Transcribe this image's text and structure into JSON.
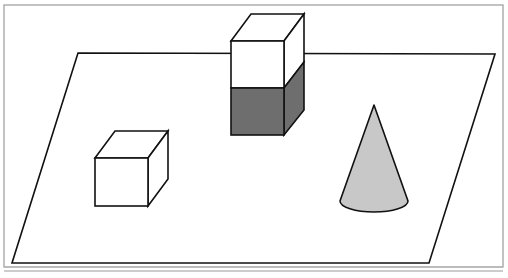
{
  "figure": {
    "colors": {
      "background": "#ffffff",
      "frame": "#9a9a9a",
      "stroke": "#111111",
      "cube_dark_fill": "#6e6e6e",
      "cone_fill": "#c8c8c8",
      "face_white": "#ffffff"
    },
    "frame": {
      "x": 4,
      "y": 5,
      "w": 499,
      "h": 262,
      "bottom_rule_y": 271
    },
    "plane": {
      "points": "78,53 495,54 429,263 12,263"
    },
    "stacked_cubes": {
      "label": "stacked cubes",
      "top_cube_color": "white",
      "bottom_cube_color": "dark gray",
      "front_left_x": 231,
      "front_right_x": 284,
      "top_y": 41,
      "mid_y": 88,
      "bottom_y": 135,
      "depth_dx": 20,
      "depth_dy": -27
    },
    "single_cube": {
      "label": "white cube",
      "front_left_x": 95,
      "front_right_x": 148,
      "top_y": 158,
      "bottom_y": 206,
      "depth_dx": 20,
      "depth_dy": -27
    },
    "cone": {
      "label": "gray cone",
      "apex_x": 374,
      "apex_y": 105,
      "base_cx": 374,
      "base_cy": 203,
      "base_rx": 34,
      "base_ry": 11
    }
  }
}
